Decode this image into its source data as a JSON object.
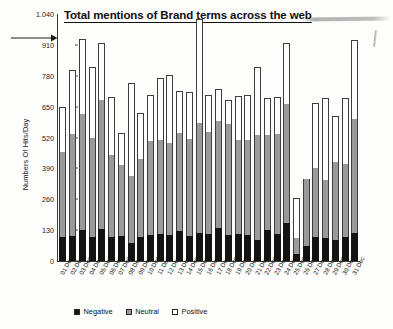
{
  "chart_data": {
    "type": "bar",
    "subtype": "stacked-bar",
    "title": "Total mentions of Brand terms across the web",
    "xlabel": "",
    "ylabel": "Numbers Of  Hits/Day",
    "ylim": [
      0,
      1040
    ],
    "ytick_values": [
      0,
      130,
      260,
      390,
      520,
      650,
      780,
      910,
      1040
    ],
    "ytick_labels": [
      "0",
      "130",
      "260",
      "390",
      "520",
      "650",
      "780",
      "910",
      "1.040"
    ],
    "grid": false,
    "legend_position": "bottom-left",
    "categories": [
      "01 Dec",
      "02 Dec",
      "03 Dec",
      "04 Dec",
      "05 Dec",
      "06 Dec",
      "07 Dec",
      "08 Dec",
      "09 Dec",
      "10 Dec",
      "11 Dec",
      "12 Dec",
      "13 Dec",
      "14 Dec",
      "15 Dec",
      "16 Dec",
      "17 Dec",
      "18 Dec",
      "19 Dec",
      "20 Dec",
      "21 Dec",
      "22 Dec",
      "23 Dec",
      "24 Dec",
      "25 Dec",
      "26 Dec",
      "27 Dec",
      "28 Dec",
      "29 Dec",
      "30 Dec",
      "31 Dec"
    ],
    "series": [
      {
        "name": "Negative",
        "color": "#131313",
        "values": [
          100,
          105,
          130,
          100,
          135,
          100,
          105,
          75,
          100,
          110,
          115,
          110,
          125,
          105,
          120,
          115,
          140,
          110,
          115,
          110,
          90,
          130,
          115,
          160,
          30,
          65,
          100,
          95,
          90,
          100,
          120
        ]
      },
      {
        "name": "Neutral",
        "color": "#9a9a9a",
        "values": [
          360,
          430,
          490,
          420,
          545,
          345,
          300,
          285,
          330,
          395,
          395,
          385,
          415,
          410,
          460,
          430,
          450,
          465,
          395,
          400,
          440,
          400,
          420,
          500,
          65,
          280,
          290,
          245,
          325,
          310,
          480
        ]
      },
      {
        "name": "Positive",
        "color": "#ffffff",
        "values": [
          190,
          270,
          315,
          295,
          240,
          245,
          135,
          390,
          195,
          195,
          260,
          290,
          175,
          195,
          440,
          155,
          135,
          105,
          185,
          190,
          285,
          155,
          155,
          260,
          170,
          0,
          275,
          345,
          195,
          275,
          330
        ]
      }
    ],
    "annotation": {
      "type": "arrow",
      "direction": "right"
    }
  },
  "legend": {
    "items": [
      {
        "label": "Negative",
        "swatch": "negative-swatch"
      },
      {
        "label": "Neutral",
        "swatch": "neutral-swatch"
      },
      {
        "label": "Positive",
        "swatch": "positive-swatch"
      }
    ]
  },
  "colors": {
    "negative": "#131313",
    "neutral": "#9a9a9a",
    "positive": "#ffffff",
    "axis": "#3a3a3a",
    "text": "#1a1a1a",
    "background": "#fdfdfc"
  }
}
